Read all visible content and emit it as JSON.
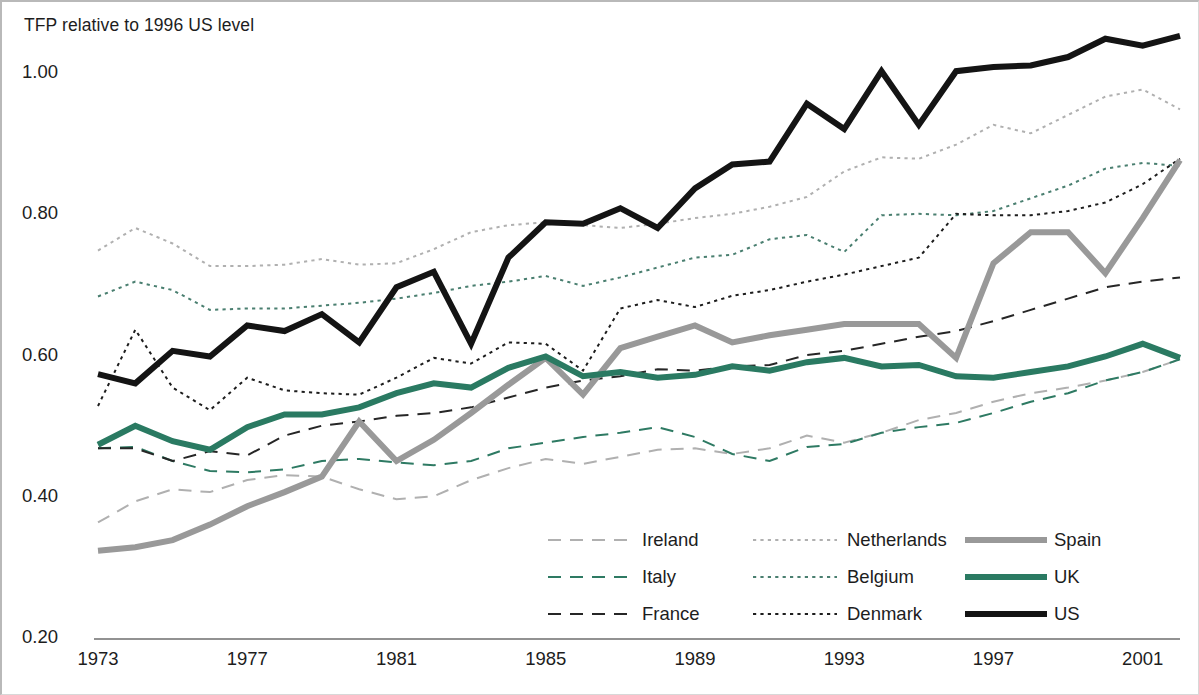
{
  "chart_data": {
    "type": "line",
    "title": "TFP relative to 1996 US level",
    "xlabel": "",
    "ylabel": "TFP relative to 1996 US level",
    "xlim": [
      1973,
      2002
    ],
    "ylim": [
      0.2,
      1.0
    ],
    "grid": false,
    "legend_position": "inside-bottom-right",
    "x_ticks": [
      "1973",
      "1977",
      "1981",
      "1985",
      "1989",
      "1993",
      "1997",
      "2001"
    ],
    "x_tick_values": [
      1973,
      1977,
      1981,
      1985,
      1989,
      1993,
      1997,
      2001
    ],
    "y_ticks": [
      "0.20",
      "0.40",
      "0.60",
      "0.80",
      "1.00"
    ],
    "y_tick_values": [
      0.2,
      0.4,
      0.6,
      0.8,
      1.0
    ],
    "x": [
      1973,
      1974,
      1975,
      1976,
      1977,
      1978,
      1979,
      1980,
      1981,
      1982,
      1983,
      1984,
      1985,
      1986,
      1987,
      1988,
      1989,
      1990,
      1991,
      1992,
      1993,
      1994,
      1995,
      1996,
      1997,
      1998,
      1999,
      2000,
      2001,
      2002
    ],
    "series": [
      {
        "name": "Ireland",
        "color": "#b0b0b0",
        "style": "dashed",
        "width": 2,
        "values": [
          0.365,
          0.395,
          0.412,
          0.408,
          0.425,
          0.432,
          0.43,
          0.412,
          0.398,
          0.402,
          0.425,
          0.442,
          0.455,
          0.448,
          0.458,
          0.468,
          0.47,
          0.462,
          0.47,
          0.488,
          0.478,
          0.492,
          0.51,
          0.52,
          0.536,
          0.548,
          0.556,
          0.566,
          0.578,
          0.596
        ]
      },
      {
        "name": "Italy",
        "color": "#2e7a63",
        "style": "dashed",
        "width": 2,
        "values": [
          0.47,
          0.472,
          0.452,
          0.438,
          0.436,
          0.44,
          0.452,
          0.455,
          0.45,
          0.446,
          0.452,
          0.47,
          0.478,
          0.486,
          0.492,
          0.5,
          0.486,
          0.462,
          0.452,
          0.472,
          0.476,
          0.492,
          0.5,
          0.506,
          0.52,
          0.536,
          0.548,
          0.566,
          0.578,
          0.596
        ]
      },
      {
        "name": "France",
        "color": "#262626",
        "style": "dashed",
        "width": 2,
        "values": [
          0.47,
          0.47,
          0.452,
          0.466,
          0.46,
          0.488,
          0.502,
          0.508,
          0.516,
          0.52,
          0.528,
          0.542,
          0.556,
          0.566,
          0.572,
          0.582,
          0.58,
          0.586,
          0.588,
          0.602,
          0.608,
          0.618,
          0.628,
          0.636,
          0.65,
          0.666,
          0.682,
          0.698,
          0.706,
          0.712
        ]
      },
      {
        "name": "Netherlands",
        "color": "#b0b0b0",
        "style": "dotted",
        "width": 2,
        "values": [
          0.75,
          0.782,
          0.76,
          0.728,
          0.728,
          0.73,
          0.738,
          0.73,
          0.732,
          0.752,
          0.776,
          0.786,
          0.79,
          0.786,
          0.782,
          0.788,
          0.796,
          0.802,
          0.812,
          0.826,
          0.862,
          0.882,
          0.88,
          0.9,
          0.928,
          0.916,
          0.942,
          0.968,
          0.978,
          0.95
        ]
      },
      {
        "name": "Belgium",
        "color": "#4a7f70",
        "style": "dotted",
        "width": 2,
        "values": [
          0.685,
          0.706,
          0.694,
          0.666,
          0.668,
          0.668,
          0.672,
          0.676,
          0.682,
          0.69,
          0.7,
          0.706,
          0.714,
          0.7,
          0.712,
          0.726,
          0.74,
          0.744,
          0.766,
          0.772,
          0.748,
          0.8,
          0.802,
          0.8,
          0.806,
          0.824,
          0.842,
          0.866,
          0.874,
          0.87
        ]
      },
      {
        "name": "Denmark",
        "color": "#1d1d1d",
        "style": "dotted",
        "width": 2,
        "values": [
          0.53,
          0.638,
          0.556,
          0.524,
          0.57,
          0.552,
          0.548,
          0.546,
          0.57,
          0.598,
          0.59,
          0.62,
          0.618,
          0.58,
          0.668,
          0.68,
          0.67,
          0.686,
          0.694,
          0.706,
          0.716,
          0.728,
          0.74,
          0.802,
          0.8,
          0.8,
          0.806,
          0.818,
          0.844,
          0.88
        ]
      },
      {
        "name": "Spain",
        "color": "#999999",
        "style": "solid",
        "width": 6,
        "values": [
          0.325,
          0.33,
          0.34,
          0.362,
          0.388,
          0.408,
          0.43,
          0.508,
          0.452,
          0.482,
          0.52,
          0.56,
          0.598,
          0.546,
          0.612,
          0.628,
          0.644,
          0.62,
          0.63,
          0.638,
          0.646,
          0.646,
          0.646,
          0.598,
          0.732,
          0.776,
          0.776,
          0.718,
          0.796,
          0.878
        ]
      },
      {
        "name": "UK",
        "color": "#2a7a62",
        "style": "solid",
        "width": 6,
        "values": [
          0.475,
          0.502,
          0.48,
          0.468,
          0.5,
          0.518,
          0.518,
          0.528,
          0.548,
          0.562,
          0.556,
          0.584,
          0.6,
          0.572,
          0.578,
          0.57,
          0.574,
          0.586,
          0.58,
          0.592,
          0.598,
          0.586,
          0.588,
          0.572,
          0.57,
          0.578,
          0.586,
          0.6,
          0.618,
          0.598
        ]
      },
      {
        "name": "US",
        "color": "#141414",
        "style": "solid",
        "width": 6,
        "values": [
          0.575,
          0.562,
          0.608,
          0.6,
          0.644,
          0.636,
          0.66,
          0.62,
          0.698,
          0.72,
          0.618,
          0.74,
          0.79,
          0.788,
          0.81,
          0.782,
          0.838,
          0.872,
          0.876,
          0.958,
          0.922,
          1.004,
          0.928,
          1.004,
          1.01,
          1.012,
          1.024,
          1.05,
          1.04,
          1.054
        ]
      }
    ]
  },
  "legend": {
    "items": [
      {
        "label": "Ireland",
        "series": "Ireland"
      },
      {
        "label": "Netherlands",
        "series": "Netherlands"
      },
      {
        "label": "Spain",
        "series": "Spain"
      },
      {
        "label": "Italy",
        "series": "Italy"
      },
      {
        "label": "Belgium",
        "series": "Belgium"
      },
      {
        "label": "UK",
        "series": "UK"
      },
      {
        "label": "France",
        "series": "France"
      },
      {
        "label": "Denmark",
        "series": "Denmark"
      },
      {
        "label": "US",
        "series": "US"
      }
    ]
  },
  "colors": {
    "ireland": "#b0b0b0",
    "italy": "#2e7a63",
    "france": "#262626",
    "netherlands": "#b0b0b0",
    "belgium": "#4a7f70",
    "denmark": "#1d1d1d",
    "spain": "#999999",
    "uk": "#2a7a62",
    "us": "#141414",
    "axis": "#6e6e6e",
    "text": "#1d1d1d",
    "frame": "#b9b9b9"
  }
}
